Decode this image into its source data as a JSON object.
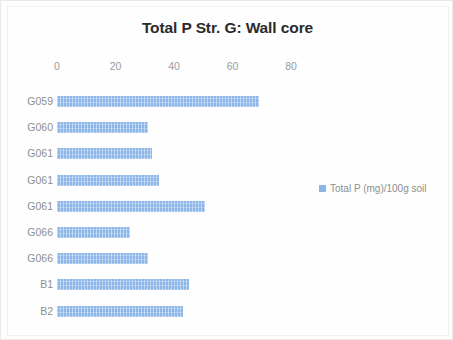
{
  "chart_data": {
    "type": "bar",
    "orientation": "horizontal",
    "title": "Total P Str. G: Wall core",
    "xlabel": "",
    "ylabel": "",
    "xlim": [
      0,
      80
    ],
    "xticks": [
      0,
      20,
      40,
      60,
      80
    ],
    "xtick_labels": [
      "0",
      "20",
      "40",
      "60",
      "80"
    ],
    "grid": false,
    "legend_position": "right",
    "categories": [
      "G059",
      "G060",
      "G061",
      "G061",
      "G061",
      "G066",
      "G066",
      "B1",
      "B2"
    ],
    "series": [
      {
        "name": "Total P (mg)/100g soil",
        "color": "#8cb6e8",
        "values": [
          69,
          31,
          32.5,
          35,
          50.5,
          25,
          31,
          45,
          43
        ]
      }
    ]
  },
  "legend": {
    "entries": [
      {
        "label": "Total P (mg)/100g soil",
        "color": "#8cb6e8"
      }
    ]
  }
}
